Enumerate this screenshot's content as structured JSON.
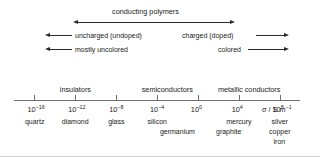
{
  "figure": {
    "title_top": "conducting polymers",
    "rows": [
      {
        "left_label": "uncharged (undoped)",
        "right_label": "charged (doped)"
      },
      {
        "left_label": "mostly uncolored",
        "right_label": "colored"
      }
    ],
    "axis_caption": "σ / S m",
    "axis_caption_exp": "−1"
  },
  "chart_data": {
    "type": "line",
    "xlabel": "σ / S m⁻¹",
    "ylabel": "",
    "scale": "log10",
    "xlim": [
      -18,
      10
    ],
    "grid": false,
    "legend": "none",
    "tick_exponents": [
      -16,
      -12,
      -8,
      -4,
      0,
      4,
      8
    ],
    "tick_labels": [
      "10⁻¹⁶",
      "10⁻¹²",
      "10⁻⁸",
      "10⁻⁴",
      "10⁰",
      "10⁴",
      "10⁸"
    ],
    "tick_mantissa": "10",
    "tick_sups": [
      "-16",
      "-12",
      "-8",
      "-4",
      "0",
      "4",
      "8"
    ],
    "bands": [
      {
        "label": "insulators",
        "center_exp": -12
      },
      {
        "label": "semiconductors",
        "center_exp": -3
      },
      {
        "label": "metallic conductors",
        "center_exp": 5
      }
    ],
    "materials": [
      {
        "name": "quartz",
        "exp": -16,
        "row": 1
      },
      {
        "name": "diamond",
        "exp": -12,
        "row": 1
      },
      {
        "name": "glass",
        "exp": -8,
        "row": 1
      },
      {
        "name": "silicon",
        "exp": -4,
        "row": 1
      },
      {
        "name": "germanium",
        "exp": -2,
        "row": 2
      },
      {
        "name": "mercury",
        "exp": 4,
        "row": 1
      },
      {
        "name": "graphite",
        "exp": 3,
        "row": 2
      },
      {
        "name": "silver",
        "exp": 8,
        "row": 1
      },
      {
        "name": "copper",
        "exp": 8,
        "row": 2
      },
      {
        "name": "iron",
        "exp": 8,
        "row": 3
      }
    ],
    "annotations": [
      {
        "label": "conducting polymers",
        "kind": "double-arrow",
        "from_exp": -10,
        "to_exp": 6
      },
      {
        "label": "uncharged (undoped)",
        "kind": "left-arrow"
      },
      {
        "label": "charged (doped)",
        "kind": "right-arrow"
      },
      {
        "label": "mostly uncolored",
        "kind": "left-arrow"
      },
      {
        "label": "colored",
        "kind": "right-arrow"
      }
    ]
  },
  "colors": {
    "ink": "#1a1a1a",
    "line": "#2b2b2b",
    "axis": "#6f6f6f",
    "background": "#ffffff"
  }
}
